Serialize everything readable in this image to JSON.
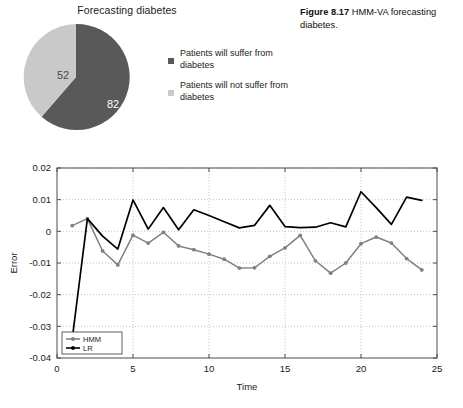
{
  "figure_caption": {
    "label": "Figure 8.17",
    "text": "HMM-VA forecasting diabetes."
  },
  "pie": {
    "title": "Forecasting diabetes",
    "legend": [
      {
        "label": "Patients will suffer from diabetes",
        "color": "#595959"
      },
      {
        "label": "Patients will not suffer from diabetes",
        "color": "#c9c9c9"
      }
    ]
  },
  "line_chart": {
    "xlabel": "Time",
    "ylabel": "Error",
    "legend": [
      {
        "label": "HMM",
        "color": "#808080"
      },
      {
        "label": "LR",
        "color": "#000000"
      }
    ],
    "x_ticks": [
      "0",
      "5",
      "10",
      "15",
      "20",
      "25"
    ],
    "y_ticks": [
      "0.02",
      "0.01",
      "0",
      "-0.01",
      "-0.02",
      "-0.03",
      "-0.04"
    ]
  },
  "chart_data": [
    {
      "type": "pie",
      "title": "Forecasting diabetes",
      "labels": [
        "Patients will suffer from diabetes",
        "Patients will not suffer from diabetes"
      ],
      "values": [
        82,
        52
      ],
      "data_labels": [
        "82",
        "52"
      ],
      "colors": [
        "#595959",
        "#c9c9c9"
      ],
      "legend_position": "right",
      "start_angle": 0
    },
    {
      "type": "line",
      "title": "",
      "xlabel": "Time",
      "ylabel": "Error",
      "xlim": [
        0,
        25
      ],
      "ylim": [
        -0.04,
        0.02
      ],
      "xticks": [
        0,
        5,
        10,
        15,
        20,
        25
      ],
      "yticks": [
        -0.04,
        -0.03,
        -0.02,
        -0.01,
        0,
        0.01,
        0.02
      ],
      "grid": true,
      "legend_position": "lower-left",
      "x": [
        1,
        2,
        3,
        4,
        5,
        6,
        7,
        8,
        9,
        10,
        11,
        12,
        13,
        14,
        15,
        16,
        17,
        18,
        19,
        20,
        21,
        22,
        23,
        24
      ],
      "series": [
        {
          "name": "HMM",
          "color": "#808080",
          "marker": "circle",
          "values": [
            0.0018,
            0.004,
            -0.0062,
            -0.0106,
            -0.0012,
            -0.0037,
            -0.0003,
            -0.0046,
            -0.0058,
            -0.0072,
            -0.0088,
            -0.0116,
            -0.0115,
            -0.0079,
            -0.0052,
            -0.0013,
            -0.0093,
            -0.0132,
            -0.01,
            -0.0039,
            -0.0018,
            -0.0037,
            -0.0086,
            -0.0122
          ]
        },
        {
          "name": "LR",
          "color": "#000000",
          "marker": "none",
          "values": [
            -0.034,
            0.004,
            -0.0015,
            -0.0056,
            0.0099,
            0.0007,
            0.0075,
            0.0005,
            0.0068,
            0.005,
            0.003,
            0.0011,
            0.0019,
            0.0082,
            0.0015,
            0.0012,
            0.0013,
            0.0027,
            0.0014,
            0.0125,
            0.0075,
            0.0022,
            0.0108,
            0.0098
          ]
        }
      ]
    }
  ]
}
